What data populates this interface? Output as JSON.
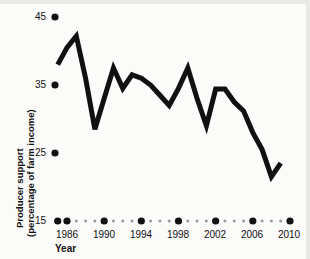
{
  "chart_data": {
    "type": "line",
    "title": "",
    "xlabel": "Year",
    "ylabel": "Producer support (percentage of farm income)",
    "ylabel_line1": "Producer support",
    "ylabel_line2": "(percentage of farm income)",
    "xlim": [
      1985,
      2010
    ],
    "ylim": [
      15,
      45
    ],
    "ytick_labels": [
      "45",
      "35",
      "25",
      "15"
    ],
    "ytick_values": [
      45,
      35,
      25,
      15
    ],
    "xtick_labels": [
      "1986",
      "1990",
      "1994",
      "1998",
      "2002",
      "2006",
      "2010"
    ],
    "xtick_values": [
      1986,
      1990,
      1994,
      1998,
      2002,
      2006,
      2010
    ],
    "minor_x_values": [
      1987,
      1988,
      1989,
      1991,
      1992,
      1993,
      1995,
      1996,
      1997,
      1999,
      2000,
      2001,
      2003,
      2004,
      2005,
      2007,
      2008,
      2009
    ],
    "grid": false,
    "legend": null,
    "legend_position": "none",
    "x": [
      1985,
      1986,
      1987,
      1988,
      1989,
      1990,
      1991,
      1992,
      1993,
      1994,
      1995,
      1996,
      1997,
      1998,
      1999,
      2000,
      2001,
      2002,
      2003,
      2004,
      2005,
      2006,
      2007,
      2008,
      2009
    ],
    "values": [
      38.0,
      40.5,
      42.2,
      36.0,
      28.5,
      33.0,
      37.5,
      34.5,
      36.5,
      36.0,
      35.0,
      33.5,
      32.0,
      34.5,
      37.5,
      33.0,
      29.0,
      34.4,
      34.4,
      32.5,
      31.2,
      28.0,
      25.5,
      21.5,
      23.5
    ],
    "series_color": "#111111",
    "line_width": 5,
    "axis_tick_style": "dot",
    "major_tick_radius": 3.6,
    "minor_tick_radius": 1.5,
    "background_color": "#fbfbfa"
  }
}
